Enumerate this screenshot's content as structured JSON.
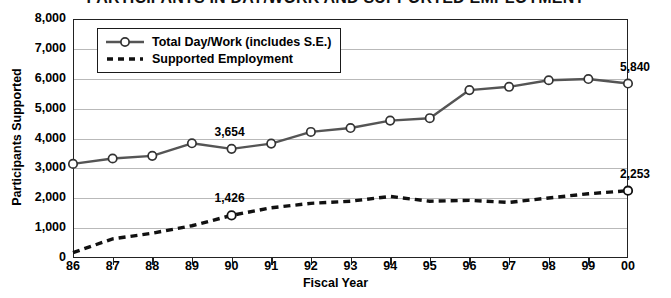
{
  "chart_data": {
    "type": "line",
    "title": "PARTICIPANTS IN DAY/WORK AND SUPPORTED EMPLOYMENT",
    "xlabel": "Fiscal Year",
    "ylabel": "Participants Supported",
    "categories": [
      "86",
      "87",
      "88",
      "89",
      "90",
      "91",
      "92",
      "93",
      "94",
      "95",
      "96",
      "97",
      "98",
      "99",
      "00"
    ],
    "ylim": [
      0,
      8000
    ],
    "ytick_labels": [
      "8,000",
      "7,000",
      "6,000",
      "5,000",
      "4,000",
      "3,000",
      "2,000",
      "1,000",
      "0"
    ],
    "ytick_values": [
      8000,
      7000,
      6000,
      5000,
      4000,
      3000,
      2000,
      1000,
      0
    ],
    "grid": true,
    "legend_position": "top-left-inside",
    "series": [
      {
        "name": "Total Day/Work (includes S.E.)",
        "style": "solid-with-open-circle-markers",
        "color": "#555555",
        "values": [
          3150,
          3330,
          3420,
          3840,
          3654,
          3830,
          4220,
          4350,
          4600,
          4680,
          5620,
          5730,
          5950,
          5990,
          5840
        ]
      },
      {
        "name": "Supported Employment",
        "style": "dashed",
        "color": "#111111",
        "values": [
          180,
          640,
          830,
          1080,
          1426,
          1680,
          1830,
          1900,
          2060,
          1900,
          1930,
          1860,
          2010,
          2150,
          2253
        ]
      }
    ],
    "annotations": [
      {
        "text": "3,654",
        "series": "Total Day/Work (includes S.E.)",
        "category": "90",
        "value": 3654
      },
      {
        "text": "5,840",
        "series": "Total Day/Work (includes S.E.)",
        "category": "00",
        "value": 5840
      },
      {
        "text": "1,426",
        "series": "Supported Employment",
        "category": "90",
        "value": 1426
      },
      {
        "text": "2,253",
        "series": "Supported Employment",
        "category": "00",
        "value": 2253
      }
    ]
  }
}
